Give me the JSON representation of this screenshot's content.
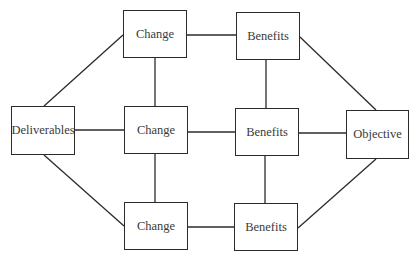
{
  "diagram": {
    "nodes": [
      {
        "id": "deliverables",
        "label": "Deliverables",
        "x": 11,
        "y": 106,
        "w": 64,
        "h": 49
      },
      {
        "id": "change_top",
        "label": "Change",
        "x": 123,
        "y": 10,
        "w": 64,
        "h": 48
      },
      {
        "id": "change_mid",
        "label": "Change",
        "x": 124,
        "y": 106,
        "w": 64,
        "h": 48
      },
      {
        "id": "change_bot",
        "label": "Change",
        "x": 124,
        "y": 202,
        "w": 64,
        "h": 48
      },
      {
        "id": "benefits_top",
        "label": "Benefits",
        "x": 236,
        "y": 12,
        "w": 64,
        "h": 48
      },
      {
        "id": "benefits_mid",
        "label": "Benefits",
        "x": 235,
        "y": 108,
        "w": 64,
        "h": 48
      },
      {
        "id": "benefits_bot",
        "label": "Benefits",
        "x": 234,
        "y": 203,
        "w": 64,
        "h": 48
      },
      {
        "id": "objective",
        "label": "Objective",
        "x": 346,
        "y": 110,
        "w": 63,
        "h": 49
      }
    ],
    "edges": [
      {
        "from": "deliverables",
        "to": "change_top"
      },
      {
        "from": "deliverables",
        "to": "change_mid"
      },
      {
        "from": "deliverables",
        "to": "change_bot"
      },
      {
        "from": "change_top",
        "to": "change_mid"
      },
      {
        "from": "change_mid",
        "to": "change_bot"
      },
      {
        "from": "change_top",
        "to": "benefits_top"
      },
      {
        "from": "change_mid",
        "to": "benefits_mid"
      },
      {
        "from": "change_bot",
        "to": "benefits_bot"
      },
      {
        "from": "benefits_top",
        "to": "benefits_mid"
      },
      {
        "from": "benefits_mid",
        "to": "benefits_bot"
      },
      {
        "from": "benefits_top",
        "to": "objective"
      },
      {
        "from": "benefits_mid",
        "to": "objective"
      },
      {
        "from": "benefits_bot",
        "to": "objective"
      }
    ],
    "line_color": "#2b2b2b"
  }
}
